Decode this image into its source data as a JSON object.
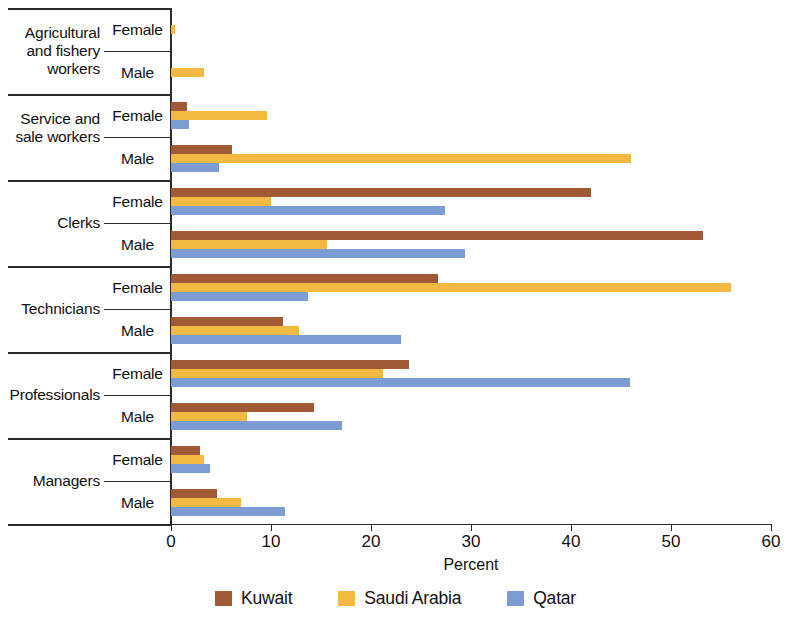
{
  "chart_data": {
    "type": "bar",
    "orientation": "horizontal",
    "title": "",
    "xlabel": "Percent",
    "ylabel": "",
    "xlim": [
      0,
      60
    ],
    "xticks": [
      "0",
      "10",
      "20",
      "30",
      "40",
      "50",
      "60"
    ],
    "grid": false,
    "legend_position": "bottom",
    "series": [
      {
        "name": "Kuwait",
        "color": "#A05A36"
      },
      {
        "name": "Saudi Arabia",
        "color": "#F4B942"
      },
      {
        "name": "Qatar",
        "color": "#7E9CD4"
      }
    ],
    "categories": [
      "Agricultural and fishery workers",
      "Service and sale workers",
      "Clerks",
      "Technicians",
      "Professionals",
      "Managers"
    ],
    "subcategories": [
      "Female",
      "Male"
    ],
    "groups": [
      {
        "label": "Agricultural and fishery workers",
        "rows": [
          {
            "sex": "Female",
            "values": {
              "Kuwait": 0.0,
              "Saudi Arabia": 0.4,
              "Qatar": 0.0
            }
          },
          {
            "sex": "Male",
            "values": {
              "Kuwait": 0.0,
              "Saudi Arabia": 3.3,
              "Qatar": 0.0
            }
          }
        ]
      },
      {
        "label": "Service and sale workers",
        "rows": [
          {
            "sex": "Female",
            "values": {
              "Kuwait": 1.6,
              "Saudi Arabia": 9.6,
              "Qatar": 1.8
            }
          },
          {
            "sex": "Male",
            "values": {
              "Kuwait": 6.1,
              "Saudi Arabia": 46.0,
              "Qatar": 4.8
            }
          }
        ]
      },
      {
        "label": "Clerks",
        "rows": [
          {
            "sex": "Female",
            "values": {
              "Kuwait": 42.0,
              "Saudi Arabia": 10.0,
              "Qatar": 27.4
            }
          },
          {
            "sex": "Male",
            "values": {
              "Kuwait": 53.2,
              "Saudi Arabia": 15.6,
              "Qatar": 29.4
            }
          }
        ]
      },
      {
        "label": "Technicians",
        "rows": [
          {
            "sex": "Female",
            "values": {
              "Kuwait": 26.7,
              "Saudi Arabia": 56.0,
              "Qatar": 13.7
            }
          },
          {
            "sex": "Male",
            "values": {
              "Kuwait": 11.2,
              "Saudi Arabia": 12.8,
              "Qatar": 23.0
            }
          }
        ]
      },
      {
        "label": "Professionals",
        "rows": [
          {
            "sex": "Female",
            "values": {
              "Kuwait": 23.8,
              "Saudi Arabia": 21.2,
              "Qatar": 45.9
            }
          },
          {
            "sex": "Male",
            "values": {
              "Kuwait": 14.3,
              "Saudi Arabia": 7.6,
              "Qatar": 17.1
            }
          }
        ]
      },
      {
        "label": "Managers",
        "rows": [
          {
            "sex": "Female",
            "values": {
              "Kuwait": 2.9,
              "Saudi Arabia": 3.3,
              "Qatar": 3.9
            }
          },
          {
            "sex": "Male",
            "values": {
              "Kuwait": 4.6,
              "Saudi Arabia": 7.0,
              "Qatar": 11.4
            }
          }
        ]
      }
    ]
  }
}
